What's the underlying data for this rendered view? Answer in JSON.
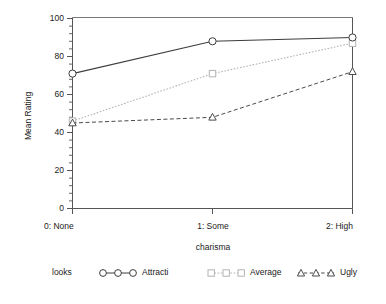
{
  "chart_data": {
    "type": "line",
    "title": "",
    "xlabel": "charisma",
    "ylabel": "Mean Rating",
    "categories": [
      "0: None",
      "1: Some",
      "2: High"
    ],
    "x": [
      0,
      1,
      2
    ],
    "ylim": [
      0,
      100
    ],
    "yticks": [
      0,
      20,
      40,
      60,
      80,
      100
    ],
    "ytick_labels": [
      "0",
      "20",
      "40",
      "60",
      "80",
      "100"
    ],
    "minor_ticks_per_interval": 4,
    "grid": false,
    "legend_position": "bottom",
    "legend_title": "looks",
    "series": [
      {
        "name": "Attracti",
        "values": [
          71,
          88,
          90
        ],
        "marker": "circle",
        "linestyle": "solid",
        "color": "#3d3d3d"
      },
      {
        "name": "Average",
        "values": [
          46,
          71,
          87
        ],
        "marker": "square",
        "linestyle": "dotted",
        "color": "#b4b4b4"
      },
      {
        "name": "Ugly",
        "values": [
          45,
          48,
          72
        ],
        "marker": "triangle",
        "linestyle": "dashed",
        "color": "#4a4a4a"
      }
    ]
  },
  "axes": {
    "y_title": "Mean Rating",
    "x_title": "charisma",
    "y_tick_labels": [
      "100",
      "80",
      "60",
      "40",
      "20",
      "0"
    ],
    "x_tick_labels": [
      "0: None",
      "1: Some",
      "2: High"
    ]
  },
  "legend": {
    "title": "looks",
    "entries": [
      {
        "label": "Attracti",
        "marker_name": "circle-marker"
      },
      {
        "label": "Average",
        "marker_name": "square-marker"
      },
      {
        "label": "Ugly",
        "marker_name": "triangle-marker"
      }
    ]
  },
  "colors": {
    "series_attractive": "#3d3d3d",
    "series_average": "#b4b4b4",
    "series_ugly": "#4a4a4a",
    "axis": "#555555",
    "text": "#1a1a1a",
    "background": "#ffffff"
  }
}
